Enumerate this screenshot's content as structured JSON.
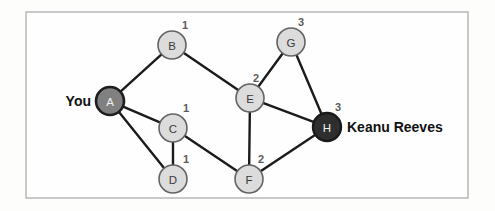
{
  "figure": {
    "kind": "weighted-undirected-graph",
    "frame": {
      "x": 26,
      "y": 12,
      "width": 442,
      "height": 186
    },
    "background_color": "#fdfdfc",
    "frame_border_color": "#9d9d9d",
    "edge_color": "#1b1b1b",
    "node_fill_light": "#dcdcdc",
    "node_fill_mid": "#808080",
    "node_fill_dark": "#2e2e2e"
  },
  "nodes": [
    {
      "id": "A",
      "label": "A",
      "x": 110,
      "y": 101,
      "r": 14,
      "style": "mid",
      "text_style": "light",
      "weight": null,
      "weight_x": 0,
      "weight_y": 0
    },
    {
      "id": "B",
      "label": "B",
      "x": 172,
      "y": 45,
      "r": 14,
      "style": "light",
      "text_style": "dark",
      "weight": "1",
      "weight_x": 185,
      "weight_y": 25
    },
    {
      "id": "C",
      "label": "C",
      "x": 173,
      "y": 128,
      "r": 14,
      "style": "light",
      "text_style": "dark",
      "weight": "1",
      "weight_x": 186,
      "weight_y": 108
    },
    {
      "id": "D",
      "label": "D",
      "x": 173,
      "y": 179,
      "r": 14,
      "style": "light",
      "text_style": "dark",
      "weight": "1",
      "weight_x": 186,
      "weight_y": 159
    },
    {
      "id": "E",
      "label": "E",
      "x": 250,
      "y": 98,
      "r": 14,
      "style": "light",
      "text_style": "dark",
      "weight": "2",
      "weight_x": 256,
      "weight_y": 78
    },
    {
      "id": "F",
      "label": "F",
      "x": 249,
      "y": 179,
      "r": 14,
      "style": "light",
      "text_style": "dark",
      "weight": "2",
      "weight_x": 261,
      "weight_y": 159
    },
    {
      "id": "G",
      "label": "G",
      "x": 291,
      "y": 42,
      "r": 14,
      "style": "light",
      "text_style": "dark",
      "weight": "3",
      "weight_x": 301,
      "weight_y": 22
    },
    {
      "id": "H",
      "label": "H",
      "x": 327,
      "y": 127,
      "r": 14,
      "style": "dark",
      "text_style": "light",
      "weight": "3",
      "weight_x": 338,
      "weight_y": 107
    }
  ],
  "edges": [
    {
      "from": "A",
      "to": "B"
    },
    {
      "from": "A",
      "to": "C"
    },
    {
      "from": "A",
      "to": "D"
    },
    {
      "from": "B",
      "to": "E"
    },
    {
      "from": "C",
      "to": "D"
    },
    {
      "from": "C",
      "to": "F"
    },
    {
      "from": "E",
      "to": "F"
    },
    {
      "from": "E",
      "to": "G"
    },
    {
      "from": "E",
      "to": "H"
    },
    {
      "from": "G",
      "to": "H"
    },
    {
      "from": "F",
      "to": "H"
    }
  ],
  "annotations": [
    {
      "id": "you",
      "text": "You",
      "x": 91,
      "y": 101,
      "align": "left-anno"
    },
    {
      "id": "keanu-reeves",
      "text": "Keanu Reeves",
      "x": 347,
      "y": 127,
      "align": "right-anno"
    }
  ]
}
